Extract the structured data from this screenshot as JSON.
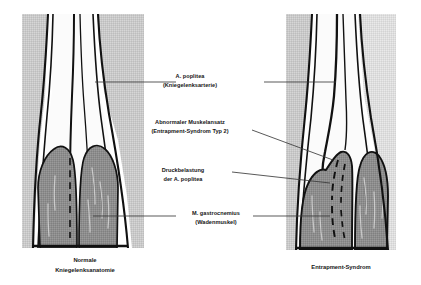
{
  "figure": {
    "title_alt": "Normale Kniegelenksanatomie und Entrapment-Syndrom",
    "colors": {
      "muscle": "#8d8d8d",
      "muscle_dark": "#7e7e7e",
      "soft_tissue": "#c6c6c6",
      "soft_tissue_light": "#d8d8d8",
      "bone": "#fbfbfb",
      "outline": "#111111",
      "leader": "#3b3b3b",
      "text": "#161616",
      "background": "#ffffff"
    }
  },
  "labels": [
    {
      "id": "a-poplitea",
      "line1": "A. poplitea",
      "line2": "(Kniegelenksarterie)"
    },
    {
      "id": "abnormaler-muskelansatz",
      "line1": "Abnormaler Muskelansatz",
      "line2": "(Entrapment-Syndrom Typ 2)"
    },
    {
      "id": "druckbelastung",
      "line1": "Druckbelastung",
      "line2": "der A. poplitea"
    },
    {
      "id": "m-gastrocnemius",
      "line1": "M. gastrocnemius",
      "line2": "(Wadenmuskel)"
    }
  ],
  "captions": [
    {
      "id": "normal",
      "line1": "Normale",
      "line2": "Kniegelenksanatomie"
    },
    {
      "id": "entrapment",
      "line1": "Entrapment-Syndrom",
      "line2": ""
    }
  ]
}
